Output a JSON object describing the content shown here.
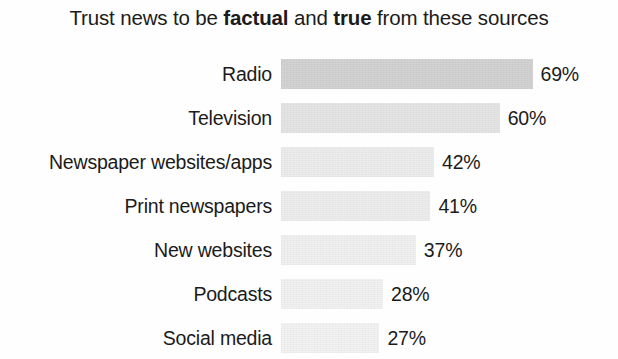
{
  "chart_data": {
    "type": "bar",
    "orientation": "horizontal",
    "title": "Trust news to be factual and true from these sources",
    "title_parts": [
      {
        "text": "Trust news to be ",
        "bold": false
      },
      {
        "text": "factual",
        "bold": true
      },
      {
        "text": " and ",
        "bold": false
      },
      {
        "text": "true",
        "bold": true
      },
      {
        "text": " from these sources",
        "bold": false
      }
    ],
    "xlabel": "",
    "ylabel": "",
    "grid": false,
    "legend": "none",
    "xlim": [
      0,
      100
    ],
    "value_suffix": "%",
    "categories": [
      "Radio",
      "Television",
      "Newspaper websites/apps",
      "Print newspapers",
      "New websites",
      "Podcasts",
      "Social media"
    ],
    "values": [
      69,
      60,
      42,
      41,
      37,
      28,
      27
    ],
    "value_labels": [
      "69%",
      "60%",
      "42%",
      "41%",
      "37%",
      "28%",
      "27%"
    ],
    "bar_colors": [
      "#d2d2d2",
      "#e4e4e4",
      "#ececec",
      "#ededed",
      "#f0f0f0",
      "#f1f1f1",
      "#f2f2f2"
    ],
    "background_color": "#fefefe",
    "text_color": "#1b1b1b"
  },
  "geometry": {
    "bar_origin_x": 281,
    "px_per_unit": 3.645,
    "row_height": 44,
    "bar_height": 30,
    "value_gap": 8
  }
}
